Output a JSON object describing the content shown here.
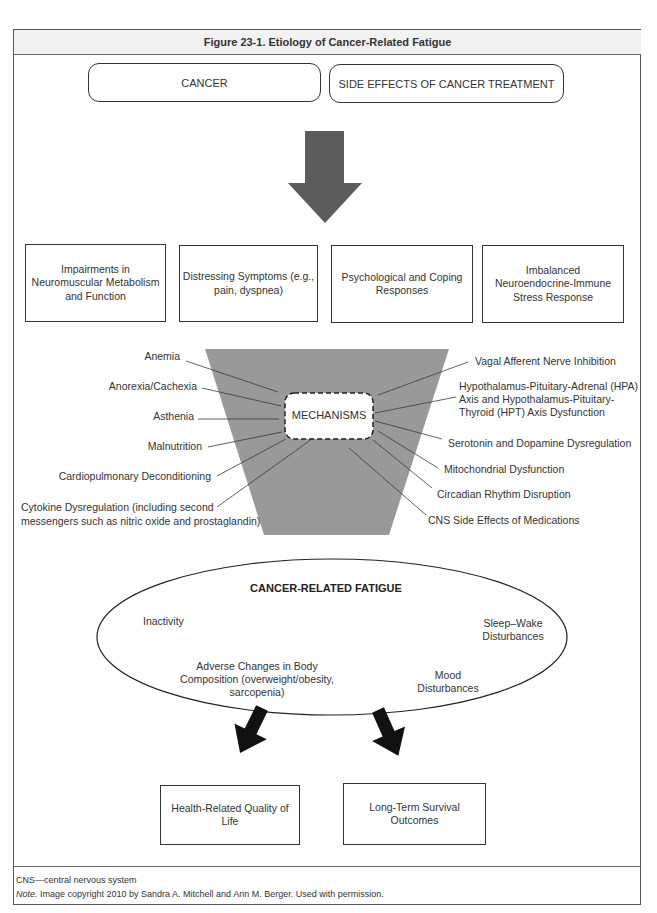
{
  "figure": {
    "title": "Figure 23-1. Etiology of Cancer-Related Fatigue"
  },
  "sources": [
    {
      "label": "CANCER"
    },
    {
      "label": "SIDE EFFECTS OF CANCER TREATMENT"
    }
  ],
  "factors": [
    {
      "lines": [
        "Impairments in",
        "Neuromuscular Metabolism",
        "and Function"
      ]
    },
    {
      "lines": [
        "Distressing Symptoms (e.g.,",
        "pain, dyspnea)"
      ]
    },
    {
      "lines": [
        "Psychological and Coping",
        "Responses"
      ]
    },
    {
      "lines": [
        "Imbalanced",
        "Neuroendocrine-Immune",
        "Stress Response"
      ]
    }
  ],
  "mechanisms": {
    "label": "MECHANISMS",
    "left": [
      {
        "lines": [
          "Anemia"
        ]
      },
      {
        "lines": [
          "Anorexia/Cachexia"
        ]
      },
      {
        "lines": [
          "Asthenia"
        ]
      },
      {
        "lines": [
          "Malnutrition"
        ]
      },
      {
        "lines": [
          "Cardiopulmonary Deconditioning"
        ]
      },
      {
        "lines": [
          "Cytokine Dysregulation (including second",
          "messengers such as nitric oxide and prostaglandin)"
        ]
      }
    ],
    "right": [
      {
        "lines": [
          "Vagal Afferent Nerve Inhibition"
        ]
      },
      {
        "lines": [
          "Hypothalamus-Pituitary-Adrenal (HPA)",
          "Axis and Hypothalamus-Pituitary-",
          "Thyroid (HPT) Axis Dysfunction"
        ]
      },
      {
        "lines": [
          "Serotonin and Dopamine Dysregulation"
        ]
      },
      {
        "lines": [
          "Mitochondrial Dysfunction"
        ]
      },
      {
        "lines": [
          "Circadian Rhythm Disruption"
        ]
      },
      {
        "lines": [
          "CNS Side Effects of Medications"
        ]
      }
    ]
  },
  "fatigue": {
    "title": "CANCER-RELATED FATIGUE",
    "items": [
      {
        "lines": [
          "Inactivity"
        ]
      },
      {
        "lines": [
          "Sleep–Wake",
          "Disturbances"
        ]
      },
      {
        "lines": [
          "Adverse Changes in Body",
          "Composition (overweight/obesity,",
          "sarcopenia)"
        ]
      },
      {
        "lines": [
          "Mood",
          "Disturbances"
        ]
      }
    ]
  },
  "outcomes": [
    {
      "lines": [
        "Health-Related Quality of",
        "Life"
      ]
    },
    {
      "lines": [
        "Long-Term Survival",
        "Outcomes"
      ]
    }
  ],
  "footer": {
    "abbreviation": "CNS—central nervous system",
    "note_label": "Note.",
    "note_text": " Image copyright 2010 by Sandra A. Mitchell and Ann M. Berger. Used with permission."
  },
  "colors": {
    "frame": "#555555",
    "title_bar_bg": "#f2f2f2",
    "big_arrow": "#5c5c5c",
    "funnel": "#999999",
    "small_arrows": "#111111",
    "text": "#333333"
  }
}
